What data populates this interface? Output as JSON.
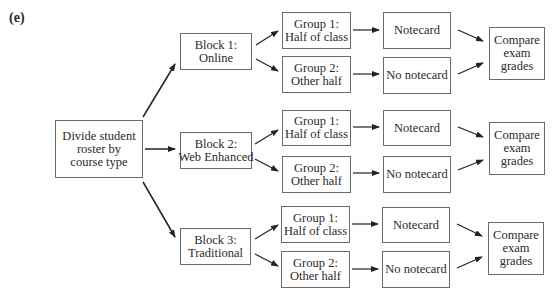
{
  "figure_label": "(e)",
  "root": {
    "lines": [
      "Divide student",
      "roster by",
      "course type"
    ]
  },
  "blocks": [
    {
      "lines": [
        "Block 1:",
        "Online"
      ]
    },
    {
      "lines": [
        "Block 2:",
        "Web Enhanced"
      ]
    },
    {
      "lines": [
        "Block 3:",
        "Traditional"
      ]
    }
  ],
  "groups": [
    {
      "g1": [
        "Group 1:",
        "Half of class"
      ],
      "g2": [
        "Group 2:",
        "Other half"
      ],
      "t1": "Notecard",
      "t2": "No notecard",
      "compare": [
        "Compare",
        "exam",
        "grades"
      ]
    },
    {
      "g1": [
        "Group 1:",
        "Half of class"
      ],
      "g2": [
        "Group 2:",
        "Other half"
      ],
      "t1": "Notecard",
      "t2": "No notecard",
      "compare": [
        "Compare",
        "exam",
        "grades"
      ]
    },
    {
      "g1": [
        "Group 1:",
        "Half of class"
      ],
      "g2": [
        "Group 2:",
        "Other half"
      ],
      "t1": "Notecard",
      "t2": "No notecard",
      "compare": [
        "Compare",
        "exam",
        "grades"
      ]
    }
  ]
}
